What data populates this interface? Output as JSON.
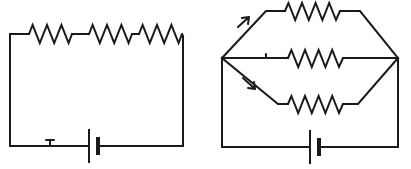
{
  "figure": {
    "kind": "circuit-diagram",
    "background_color": "#ffffff",
    "line_color": "#1a1a1a",
    "width": 411,
    "height": 169
  },
  "circuits": [
    {
      "id": "series-circuit",
      "name": "Series circuit",
      "topology": "series",
      "resistor_count": 3,
      "battery_count": 1,
      "current_arrow_count": 1,
      "outline": {
        "left": 10,
        "right": 183,
        "top": 34,
        "bottom": 146
      },
      "resistors": [
        {
          "id": "R1",
          "branch": "top-rail",
          "order": 1,
          "zigzags": 6,
          "x_start": 29,
          "x_end": 72,
          "y": 34
        },
        {
          "id": "R2",
          "branch": "top-rail",
          "order": 2,
          "zigzags": 6,
          "x_start": 89,
          "x_end": 132,
          "y": 34
        },
        {
          "id": "R3",
          "branch": "top-rail",
          "order": 3,
          "zigzags": 6,
          "x_start": 139,
          "x_end": 182,
          "y": 34
        }
      ],
      "battery": {
        "id": "B1",
        "branch": "bottom-rail",
        "x": 89,
        "y": 146,
        "long_plate_height": 34,
        "short_plate_height": 18
      },
      "arrows": [
        {
          "id": "I1",
          "branch": "bottom-rail",
          "x": 51,
          "y": 144,
          "direction": "left"
        }
      ]
    },
    {
      "id": "parallel-circuit",
      "name": "Parallel circuit",
      "topology": "parallel",
      "resistor_count": 3,
      "battery_count": 1,
      "current_arrow_count": 3,
      "outline": {
        "left": 222,
        "right": 398,
        "top": 10,
        "bottom": 147
      },
      "nodes": {
        "left_junction": {
          "x": 222,
          "y": 58
        },
        "right_junction": {
          "x": 398,
          "y": 58
        }
      },
      "branches": [
        {
          "id": "branch-top",
          "resistor": {
            "id": "R4",
            "zigzags": 6,
            "x_start": 285,
            "x_end": 340,
            "y": 10
          },
          "arrow": {
            "id": "I2",
            "x": 243,
            "y": 22,
            "direction": "up-right"
          }
        },
        {
          "id": "branch-middle",
          "resistor": {
            "id": "R5",
            "zigzags": 6,
            "x_start": 288,
            "x_end": 343,
            "y": 58
          },
          "arrow": {
            "id": "I3",
            "x": 266,
            "y": 56,
            "direction": "right"
          }
        },
        {
          "id": "branch-bottom",
          "resistor": {
            "id": "R6",
            "zigzags": 6,
            "x_start": 288,
            "x_end": 343,
            "y": 103
          },
          "arrow": {
            "id": "I4",
            "x": 250,
            "y": 84,
            "direction": "down-right"
          }
        }
      ],
      "battery": {
        "id": "B2",
        "branch": "bottom-rail",
        "x": 310,
        "y": 147,
        "long_plate_height": 34,
        "short_plate_height": 18
      }
    }
  ]
}
